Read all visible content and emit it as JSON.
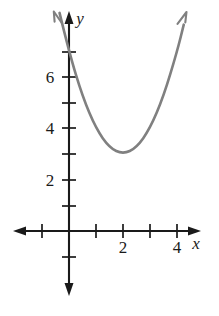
{
  "figure": {
    "background_color": "#ffffff",
    "axis_color": "#1a1a1a",
    "curve_color": "#808080",
    "x_axis_label": "x",
    "y_axis_label": "y"
  },
  "chart_data": {
    "type": "line",
    "title": "",
    "xlabel": "x",
    "ylabel": "y",
    "xlim": [
      -1.6,
      4.9
    ],
    "ylim": [
      -1.5,
      8.1
    ],
    "grid": false,
    "legend": null,
    "curve_color": "#808080",
    "equation": "y = (x - 2)^2 + 3",
    "vertex": [
      2,
      3
    ],
    "y_intercept": 7,
    "x_ticks": [
      -1,
      1,
      2,
      3,
      4
    ],
    "x_tick_labels": [
      "",
      "",
      "2",
      "",
      "4"
    ],
    "y_ticks": [
      -1,
      1,
      2,
      3,
      4,
      5,
      6,
      7
    ],
    "y_tick_labels": [
      "",
      "",
      "2",
      "",
      "4",
      "",
      "6",
      ""
    ],
    "x": [
      -0.35,
      0,
      0.5,
      1,
      1.5,
      2,
      2.5,
      3,
      3.5,
      4,
      4.25
    ],
    "values": [
      8.52,
      7,
      5.25,
      4,
      3.25,
      3,
      3.25,
      4,
      5.25,
      7,
      8.06
    ],
    "annotations": [
      {
        "text": "2",
        "x": 2,
        "y": -0.62
      },
      {
        "text": "4",
        "x": 4,
        "y": -0.62
      },
      {
        "text": "2",
        "x": -0.72,
        "y": 2
      },
      {
        "text": "4",
        "x": -0.72,
        "y": 4
      },
      {
        "text": "6",
        "x": -0.72,
        "y": 6
      },
      {
        "text": "x",
        "x": 4.68,
        "y": -0.48
      },
      {
        "text": "y",
        "x": 0.41,
        "y": 8.33
      }
    ]
  }
}
